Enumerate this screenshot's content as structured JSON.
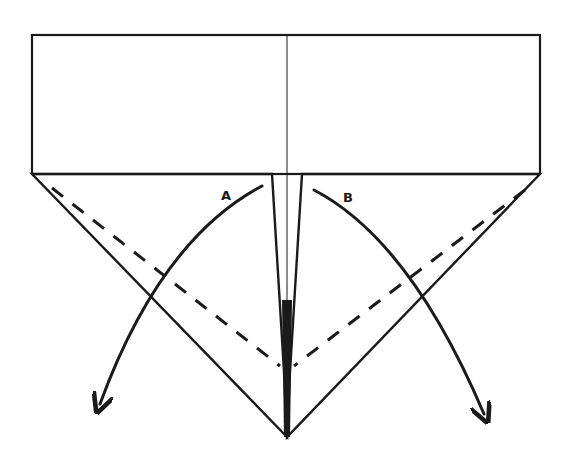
{
  "diagram": {
    "type": "origami-fold-instruction",
    "stroke_color": "#1a1a1a",
    "background": "#ffffff",
    "labels": {
      "flap_a": "A",
      "flap_b": "B"
    },
    "elements": [
      "top-rectangle",
      "center-crease-line",
      "left-triangle-flap",
      "right-triangle-flap",
      "left-dashed-valley-fold",
      "right-dashed-valley-fold",
      "arrow-a-fold-out-left",
      "arrow-b-fold-out-right"
    ]
  }
}
